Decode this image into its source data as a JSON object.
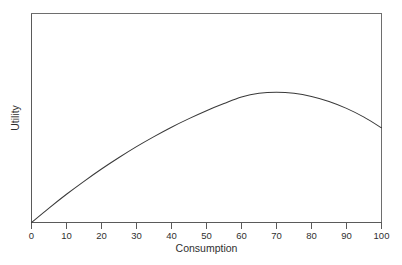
{
  "figure": {
    "title": "",
    "background_color": "#ffffff",
    "width": 402,
    "height": 265
  },
  "chart_data": {
    "type": "line",
    "title": "",
    "subtitle": "",
    "xlabel": "Consumption",
    "ylabel": "Utility",
    "xlim": [
      0,
      100
    ],
    "ylim": [
      0,
      100
    ],
    "grid": false,
    "legend": null,
    "legend_position": "none",
    "x_ticks": [
      0,
      10,
      20,
      30,
      40,
      50,
      60,
      70,
      80,
      90,
      100
    ],
    "x_tick_labels": [
      "0",
      "10",
      "20",
      "30",
      "40",
      "50",
      "60",
      "70",
      "80",
      "90",
      "100"
    ],
    "y_ticks": [],
    "y_tick_labels": [],
    "series": [
      {
        "name": "Utility",
        "color": "#3a3a3a",
        "x": [
          0,
          5,
          10,
          15,
          20,
          25,
          30,
          35,
          40,
          45,
          50,
          55,
          60,
          65,
          70,
          75,
          80,
          85,
          90,
          95,
          100
        ],
        "y": [
          0,
          6.9,
          13.5,
          19.7,
          25.6,
          31.1,
          36.3,
          41.1,
          45.6,
          49.7,
          53.5,
          56.9,
          60.0,
          61.8,
          62.3,
          61.8,
          60.3,
          57.9,
          54.6,
          50.4,
          45.3
        ]
      }
    ],
    "annotations": [
      {
        "text": "peak",
        "x": 70,
        "y": 62.3,
        "visible": false
      }
    ]
  },
  "axes": {
    "x_axis_name": "consumption-axis",
    "y_axis_name": "utility-axis",
    "x_title": "Consumption",
    "y_title": "Utility"
  },
  "colors": {
    "curve": "#3a3a3a",
    "frame": "#6e6e6e",
    "axis": "#5a5a5a",
    "text": "#2f2f2f",
    "background": "#ffffff"
  }
}
